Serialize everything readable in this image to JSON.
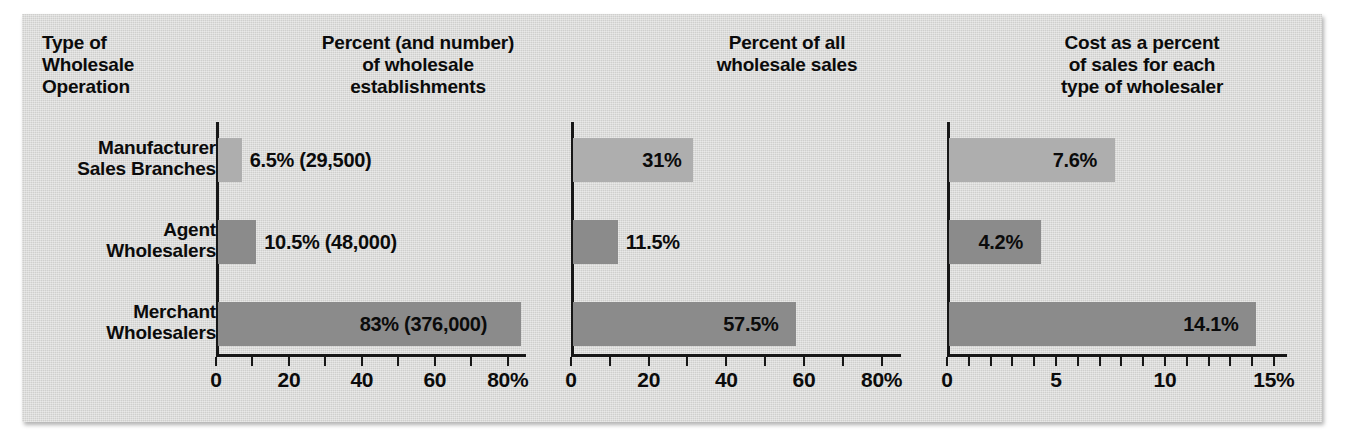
{
  "panel": {
    "background_color": "#d5d5d3"
  },
  "headers": {
    "row_label_header": "Type of\nWholesale\nOperation",
    "row_label_header_lines": [
      "Type of",
      "Wholesale",
      "Operation"
    ],
    "chart1": [
      "Percent (and number)",
      "of wholesale",
      "establishments"
    ],
    "chart2": [
      "Percent of all",
      "wholesale sales"
    ],
    "chart3": [
      "Cost as a percent",
      "of sales for each",
      "type of wholesaler"
    ]
  },
  "rows": [
    {
      "line1": "Manufacturer",
      "line2": "Sales Branches",
      "color": "#aeaeae"
    },
    {
      "line1": "Agent",
      "line2": "Wholesalers",
      "color": "#8b8b8b"
    },
    {
      "line1": "Merchant",
      "line2": "Wholesalers",
      "color": "#8b8b8b"
    }
  ],
  "chart_data": [
    {
      "type": "bar",
      "orientation": "horizontal",
      "title": "Percent (and number) of wholesale establishments",
      "categories": [
        "Manufacturer Sales Branches",
        "Agent Wholesalers",
        "Merchant Wholesalers"
      ],
      "values": [
        6.5,
        10.5,
        83
      ],
      "data_labels": [
        "6.5% (29,500)",
        "10.5% (48,000)",
        "83% (376,000)"
      ],
      "counts": [
        29500,
        48000,
        376000
      ],
      "xlabel": "",
      "ylabel": "",
      "xlim": [
        0,
        85
      ],
      "xticks": [
        0,
        10,
        20,
        30,
        40,
        50,
        60,
        70,
        80
      ],
      "xtick_labels": [
        "0",
        "",
        "20",
        "",
        "40",
        "",
        "60",
        "",
        "80%"
      ],
      "grid": false,
      "legend": "none"
    },
    {
      "type": "bar",
      "orientation": "horizontal",
      "title": "Percent of all wholesale sales",
      "categories": [
        "Manufacturer Sales Branches",
        "Agent Wholesalers",
        "Merchant Wholesalers"
      ],
      "values": [
        31,
        11.5,
        57.5
      ],
      "data_labels": [
        "31%",
        "11.5%",
        "57.5%"
      ],
      "xlabel": "",
      "ylabel": "",
      "xlim": [
        0,
        85
      ],
      "xticks": [
        0,
        10,
        20,
        30,
        40,
        50,
        60,
        70,
        80
      ],
      "xtick_labels": [
        "0",
        "",
        "20",
        "",
        "40",
        "",
        "60",
        "",
        "80%"
      ],
      "grid": false,
      "legend": "none"
    },
    {
      "type": "bar",
      "orientation": "horizontal",
      "title": "Cost as a percent of sales for each type of wholesaler",
      "categories": [
        "Manufacturer Sales Branches",
        "Agent Wholesalers",
        "Merchant Wholesalers"
      ],
      "values": [
        7.6,
        4.2,
        14.1
      ],
      "data_labels": [
        "7.6%",
        "4.2%",
        "14.1%"
      ],
      "xlabel": "",
      "ylabel": "",
      "xlim": [
        0,
        15.6
      ],
      "xticks": [
        0,
        1,
        2,
        3,
        4,
        5,
        6,
        7,
        8,
        9,
        10,
        11,
        12,
        13,
        14,
        15
      ],
      "xtick_labels": [
        "0",
        "",
        "",
        "",
        "",
        "5",
        "",
        "",
        "",
        "",
        "10",
        "",
        "",
        "",
        "",
        "15%"
      ],
      "grid": false,
      "legend": "none"
    }
  ]
}
